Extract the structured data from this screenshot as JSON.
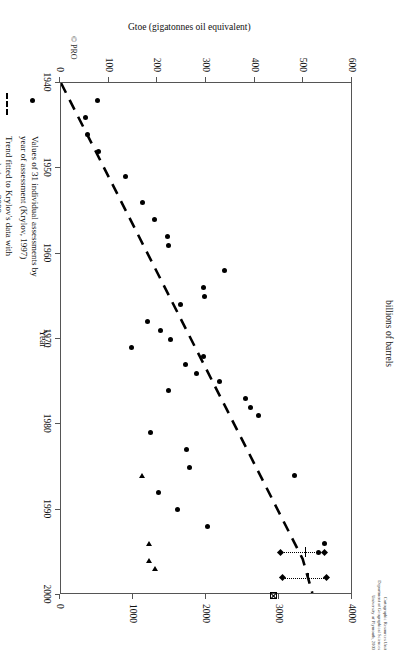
{
  "chart_data": {
    "type": "scatter",
    "title": "",
    "xlabel": "Year",
    "ylabel": "Gtoe (gigatonnes oil equivalent)",
    "y2label": "billions of barrels",
    "xlim": [
      1940,
      2000
    ],
    "ylim": [
      0,
      600
    ],
    "y2lim": [
      0,
      4000
    ],
    "xticks": [
      1940,
      1950,
      1960,
      1970,
      1980,
      1990,
      2000
    ],
    "yticks": [
      0,
      100,
      200,
      300,
      400,
      500,
      600
    ],
    "y2ticks": [
      0,
      1000,
      2000,
      3000,
      4000
    ],
    "grid": false,
    "legend_position": "below-plot-left",
    "series": [
      {
        "name": "Values of 31 individual assessments by year of assessment (Krylov, 1997)",
        "marker": "filled-circle",
        "points": [
          [
            1942,
            80
          ],
          [
            1944,
            55
          ],
          [
            1946,
            58
          ],
          [
            1948,
            82
          ],
          [
            1951,
            137
          ],
          [
            1954,
            172
          ],
          [
            1956,
            196
          ],
          [
            1958,
            222
          ],
          [
            1959,
            226
          ],
          [
            1962,
            340
          ],
          [
            1964,
            297
          ],
          [
            1965,
            298
          ],
          [
            1966,
            250
          ],
          [
            1968,
            182
          ],
          [
            1969,
            208
          ],
          [
            1970,
            230
          ],
          [
            1971,
            148
          ],
          [
            1972,
            296
          ],
          [
            1973,
            260
          ],
          [
            1974,
            282
          ],
          [
            1975,
            330
          ],
          [
            1976,
            224
          ],
          [
            1977,
            383
          ],
          [
            1978,
            394
          ],
          [
            1979,
            410
          ],
          [
            1981,
            187
          ],
          [
            1983,
            262
          ],
          [
            1985,
            268
          ],
          [
            1986,
            484
          ],
          [
            1988,
            205
          ],
          [
            1990,
            243
          ],
          [
            1992,
            305
          ],
          [
            1994,
            545
          ],
          [
            1995,
            533
          ]
        ]
      },
      {
        "name": "Trend fitted to Krylov's data with extrapolation to 2000",
        "marker": "dashed-line",
        "line": [
          [
            1940,
            0
          ],
          [
            1996,
            500
          ],
          [
            2000,
            520
          ]
        ]
      },
      {
        "name": "Value range for Shell's assessments in 1995 and 1998",
        "marker": "range-bar",
        "ranges": [
          {
            "year": 1995,
            "low": 455,
            "mid": 500,
            "high": 545
          },
          {
            "year": 1998,
            "low": 460,
            "mid": 505,
            "high": 550
          }
        ]
      },
      {
        "name": "Flat Earthers' assessments (MacKenzie, 1996 and Campbell, 1999)",
        "marker": "left-triangle",
        "points": [
          [
            1986,
            170
          ],
          [
            1994,
            185
          ],
          [
            1996,
            185
          ],
          [
            1997,
            198
          ]
        ]
      },
      {
        "name": "United States Geological Service World Energy Assessment, 2000",
        "marker": "crossed-square",
        "points": [
          [
            2000,
            440
          ]
        ]
      }
    ]
  },
  "legend": {
    "items": [
      {
        "symbol": "filled-circle",
        "label": "Values of 31 individual assessments by\nyear of assessment (Krylov, 1997)"
      },
      {
        "symbol": "dashed-line",
        "label": "Trend fitted to Krylov's data with\nextrapolation to 2000"
      },
      {
        "symbol": "range-bar",
        "label": "Value range for Shell's assessments in 1995 and 1998"
      },
      {
        "symbol": "left-triangle",
        "label": "Flat Earthers' assessments (MacKenzie, 1996 and Campbell, 1999)"
      },
      {
        "symbol": "crossed-square",
        "label": "United States Geological Service World Energy Assessment, 2000"
      }
    ]
  },
  "credit": {
    "lines": "Cartographic Resources Unit\nDepartment of Geographical Sciences\nUniversity of Plymouth, 2003",
    "copyright": "© PRO"
  },
  "axes": {
    "x_title": "Year",
    "y_title": "Gtoe (gigatonnes oil equivalent)",
    "y2_title": "billions of barrels"
  }
}
